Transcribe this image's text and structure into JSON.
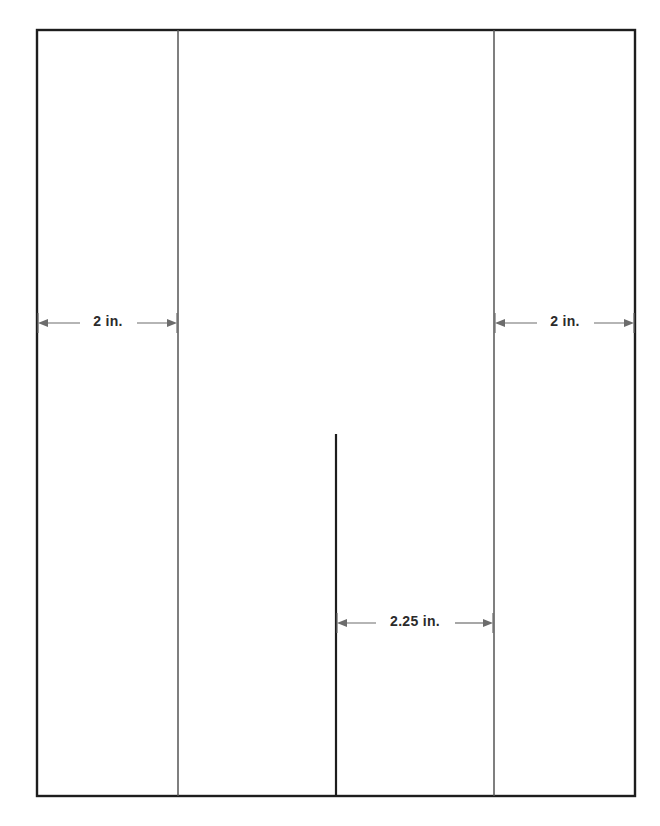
{
  "diagram": {
    "background_color": "#ffffff",
    "outline_color": "#1d1d1d",
    "divider_color": "#555555",
    "dimension_color": "#6c6c6c",
    "text_color": "#2b2b2b",
    "frame": {
      "x": 37,
      "y": 30,
      "width": 598,
      "height": 766
    },
    "dividers": [
      {
        "name": "left-divider",
        "x": 178
      },
      {
        "name": "right-divider",
        "x": 494
      }
    ],
    "cut_line": {
      "name": "center-cut-line",
      "x": 336,
      "y_top": 434,
      "y_bottom": 796
    },
    "dimensions": [
      {
        "name": "left-panel-width",
        "label": "2 in.",
        "x_start": 38,
        "x_end": 177,
        "y": 323,
        "text_x": 108,
        "text_y": 322
      },
      {
        "name": "right-panel-width",
        "label": "2 in.",
        "x_start": 495,
        "x_end": 634,
        "y": 323,
        "text_x": 565,
        "text_y": 322
      },
      {
        "name": "center-flap-width",
        "label": "2.25 in.",
        "x_start": 337,
        "x_end": 493,
        "y": 623,
        "text_x": 415,
        "text_y": 622
      }
    ]
  }
}
